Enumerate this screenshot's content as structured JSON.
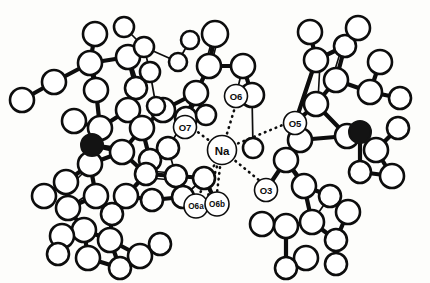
{
  "figure": {
    "kind": "crystal-structure-ortep-diagram",
    "background_color": "#fdfdfb",
    "line_color": "#0d0d0d",
    "open_atom_fill": "#ffffff",
    "filled_atom_fill": "#131313",
    "width": 430,
    "height": 283
  },
  "labels": {
    "center_cation": "Na",
    "oxygen_o3": "O3",
    "oxygen_o5": "O5",
    "oxygen_o6": "O6",
    "oxygen_o6a": "O6a",
    "oxygen_o6b": "O6b",
    "oxygen_o7": "O7"
  },
  "chart_data": {
    "type": "scatter",
    "title": "",
    "xlabel": "",
    "ylabel": "",
    "xlim": [
      0,
      430
    ],
    "ylim": [
      0,
      283
    ],
    "grid": false,
    "legend": false,
    "annotations": [
      {
        "text": "Na",
        "x": 222,
        "y": 150,
        "r": 14.5,
        "font_size": 11.5
      },
      {
        "text": "O6",
        "x": 236,
        "y": 96,
        "r": 11.5,
        "font_size": 9.5
      },
      {
        "text": "O7",
        "x": 185,
        "y": 127,
        "r": 11.5,
        "font_size": 9.5
      },
      {
        "text": "O5",
        "x": 295,
        "y": 123,
        "r": 11.5,
        "font_size": 9.5
      },
      {
        "text": "O3",
        "x": 266,
        "y": 190,
        "r": 11.5,
        "font_size": 9.5
      },
      {
        "text": "O6a",
        "x": 196,
        "y": 206,
        "r": 12.0,
        "font_size": 8.2
      },
      {
        "text": "O6b",
        "x": 217,
        "y": 204,
        "r": 12.0,
        "font_size": 8.2
      }
    ],
    "series": [
      {
        "name": "open-atoms",
        "marker": "open-circle",
        "points": [
          [
            22,
            100,
            12
          ],
          [
            54,
            82,
            12
          ],
          [
            90,
            63,
            12
          ],
          [
            95,
            34,
            12
          ],
          [
            128,
            57,
            12
          ],
          [
            124,
            27,
            10
          ],
          [
            144,
            47,
            10
          ],
          [
            150,
            72,
            10
          ],
          [
            136,
            88,
            11
          ],
          [
            128,
            110,
            12
          ],
          [
            96,
            90,
            12
          ],
          [
            74,
            121,
            12
          ],
          [
            100,
            128,
            12
          ],
          [
            142,
            128,
            12
          ],
          [
            163,
            110,
            12
          ],
          [
            168,
            148,
            11
          ],
          [
            150,
            160,
            11
          ],
          [
            122,
            152,
            12
          ],
          [
            196,
            93,
            12
          ],
          [
            209,
            66,
            12
          ],
          [
            215,
            34,
            13
          ],
          [
            186,
            118,
            11
          ],
          [
            206,
            115,
            10
          ],
          [
            243,
            66,
            12
          ],
          [
            252,
            95,
            12
          ],
          [
            176,
            176,
            11
          ],
          [
            204,
            178,
            11
          ],
          [
            146,
            174,
            11
          ],
          [
            126,
            196,
            12
          ],
          [
            152,
            200,
            11
          ],
          [
            183,
            197,
            11
          ],
          [
            90,
            164,
            12
          ],
          [
            66,
            182,
            12
          ],
          [
            44,
            196,
            12
          ],
          [
            68,
            208,
            12
          ],
          [
            96,
            196,
            12
          ],
          [
            112,
            214,
            11
          ],
          [
            84,
            230,
            12
          ],
          [
            110,
            240,
            12
          ],
          [
            62,
            236,
            12
          ],
          [
            88,
            258,
            12
          ],
          [
            140,
            256,
            12
          ],
          [
            120,
            268,
            11
          ],
          [
            160,
            244,
            11
          ],
          [
            316,
            60,
            12
          ],
          [
            310,
            32,
            12
          ],
          [
            345,
            46,
            11
          ],
          [
            336,
            80,
            12
          ],
          [
            358,
            28,
            12
          ],
          [
            380,
            62,
            12
          ],
          [
            370,
            92,
            12
          ],
          [
            400,
            98,
            11
          ],
          [
            316,
            104,
            12
          ],
          [
            300,
            140,
            12
          ],
          [
            347,
            136,
            12
          ],
          [
            376,
            150,
            12
          ],
          [
            398,
            128,
            11
          ],
          [
            392,
            176,
            12
          ],
          [
            286,
            160,
            12
          ],
          [
            304,
            186,
            12
          ],
          [
            330,
            196,
            11
          ],
          [
            348,
            212,
            12
          ],
          [
            312,
            222,
            12
          ],
          [
            336,
            240,
            11
          ],
          [
            286,
            226,
            12
          ],
          [
            306,
            258,
            12
          ],
          [
            262,
            224,
            12
          ],
          [
            286,
            268,
            11
          ],
          [
            360,
            172,
            11
          ],
          [
            253,
            148,
            10
          ],
          [
            178,
            62,
            9
          ],
          [
            190,
            40,
            9
          ],
          [
            156,
            106,
            9
          ],
          [
            58,
            254,
            11
          ],
          [
            336,
            264,
            11
          ]
        ]
      },
      {
        "name": "filled-atoms",
        "marker": "filled-circle",
        "points": [
          [
            92,
            145,
            11
          ],
          [
            360,
            132,
            11
          ]
        ]
      }
    ]
  }
}
